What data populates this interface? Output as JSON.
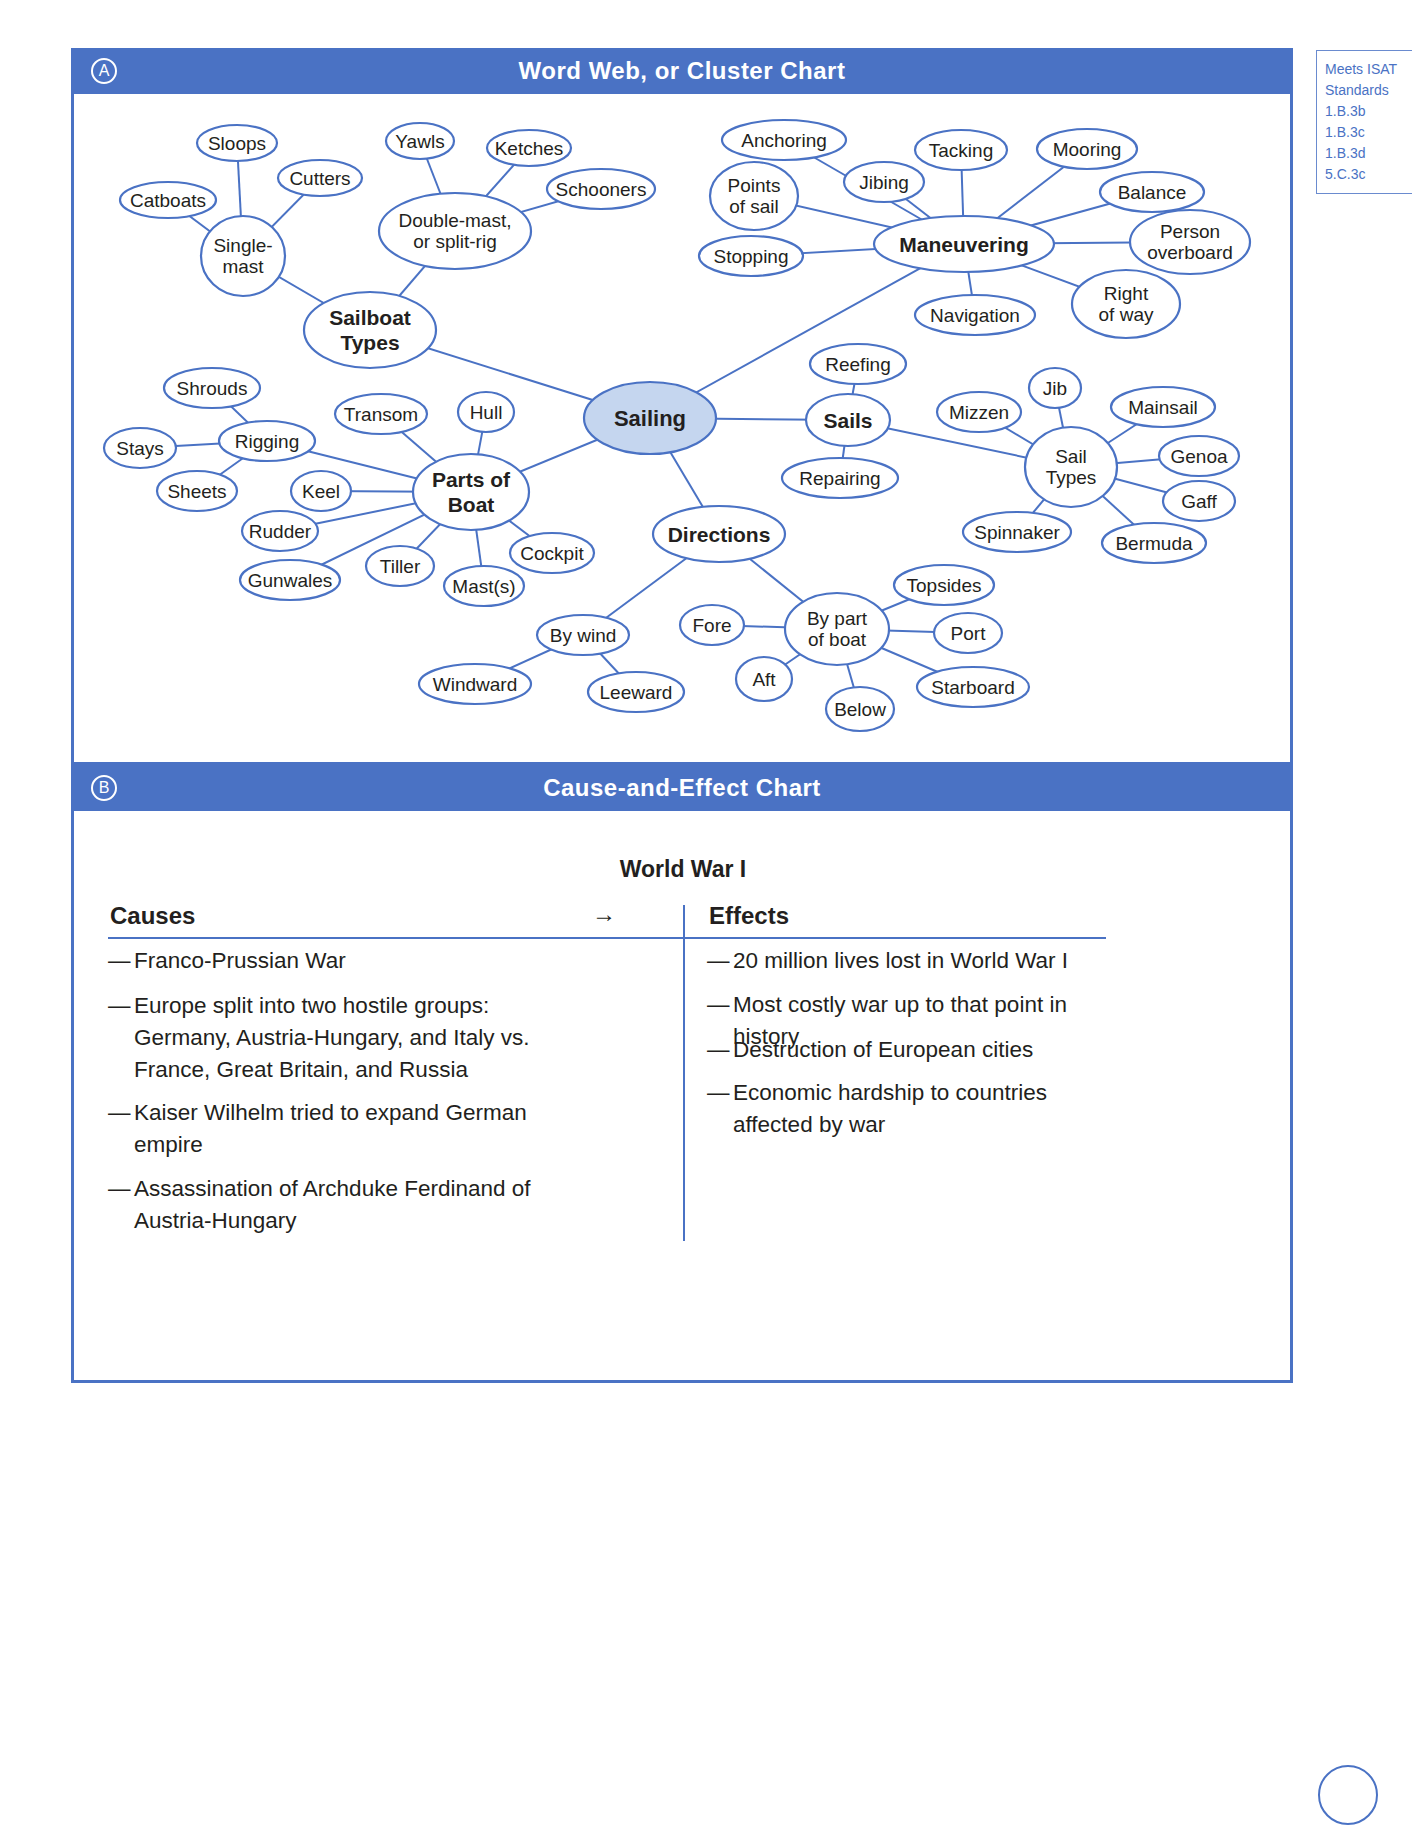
{
  "section_a": {
    "letter": "A",
    "title": "Word Web, or Cluster Chart",
    "center_node": "Sailing",
    "branches": [
      {
        "label": "Sailboat Types",
        "children": [
          {
            "label": "Single-mast",
            "children": [
              "Sloops",
              "Cutters",
              "Catboats"
            ]
          },
          {
            "label": "Double-mast, or split-rig",
            "children": [
              "Yawls",
              "Ketches",
              "Schooners"
            ]
          }
        ]
      },
      {
        "label": "Maneuvering",
        "children": [
          "Anchoring",
          "Points of sail",
          "Jibing",
          "Tacking",
          "Mooring",
          "Balance",
          "Person overboard",
          "Right of way",
          "Navigation",
          "Stopping"
        ]
      },
      {
        "label": "Sails",
        "children": [
          "Reefing",
          "Repairing",
          {
            "label": "Sail Types",
            "children": [
              "Mizzen",
              "Jib",
              "Mainsail",
              "Genoa",
              "Gaff",
              "Spinnaker",
              "Bermuda"
            ]
          }
        ]
      },
      {
        "label": "Parts of Boat",
        "children": [
          "Transom",
          "Hull",
          "Keel",
          "Rudder",
          "Gunwales",
          "Tiller",
          "Mast(s)",
          "Cockpit",
          {
            "label": "Rigging",
            "children": [
              "Shrouds",
              "Stays",
              "Sheets"
            ]
          }
        ]
      },
      {
        "label": "Directions",
        "children": [
          {
            "label": "By wind",
            "children": [
              "Windward",
              "Leeward"
            ]
          },
          {
            "label": "By part of boat",
            "children": [
              "Fore",
              "Topsides",
              "Port",
              "Aft",
              "Below",
              "Starboard"
            ]
          }
        ]
      }
    ],
    "nodes": {
      "sailing": [
        "Sailing"
      ],
      "sailboat_types": [
        "Sailboat",
        "Types"
      ],
      "single_mast": [
        "Single-",
        "mast"
      ],
      "sloops": [
        "Sloops"
      ],
      "cutters": [
        "Cutters"
      ],
      "catboats": [
        "Catboats"
      ],
      "double_mast": [
        "Double-mast,",
        "or split-rig"
      ],
      "yawls": [
        "Yawls"
      ],
      "ketches": [
        "Ketches"
      ],
      "schooners": [
        "Schooners"
      ],
      "maneuvering": [
        "Maneuvering"
      ],
      "anchoring": [
        "Anchoring"
      ],
      "points_of_sail": [
        "Points",
        "of sail"
      ],
      "jibing": [
        "Jibing"
      ],
      "tacking": [
        "Tacking"
      ],
      "mooring": [
        "Mooring"
      ],
      "balance": [
        "Balance"
      ],
      "person_overboard": [
        "Person",
        "overboard"
      ],
      "right_of_way": [
        "Right",
        "of way"
      ],
      "navigation": [
        "Navigation"
      ],
      "stopping": [
        "Stopping"
      ],
      "sails": [
        "Sails"
      ],
      "reefing": [
        "Reefing"
      ],
      "repairing": [
        "Repairing"
      ],
      "sail_types": [
        "Sail",
        "Types"
      ],
      "mizzen": [
        "Mizzen"
      ],
      "jib": [
        "Jib"
      ],
      "mainsail": [
        "Mainsail"
      ],
      "genoa": [
        "Genoa"
      ],
      "gaff": [
        "Gaff"
      ],
      "spinnaker": [
        "Spinnaker"
      ],
      "bermuda": [
        "Bermuda"
      ],
      "parts_of_boat": [
        "Parts of",
        "Boat"
      ],
      "transom": [
        "Transom"
      ],
      "hull": [
        "Hull"
      ],
      "rigging": [
        "Rigging"
      ],
      "shrouds": [
        "Shrouds"
      ],
      "stays": [
        "Stays"
      ],
      "sheets": [
        "Sheets"
      ],
      "keel": [
        "Keel"
      ],
      "rudder": [
        "Rudder"
      ],
      "gunwales": [
        "Gunwales"
      ],
      "tiller": [
        "Tiller"
      ],
      "masts": [
        "Mast(s)"
      ],
      "cockpit": [
        "Cockpit"
      ],
      "directions": [
        "Directions"
      ],
      "by_wind": [
        "By wind"
      ],
      "windward": [
        "Windward"
      ],
      "leeward": [
        "Leeward"
      ],
      "by_part_of_boat": [
        "By part",
        "of boat"
      ],
      "fore": [
        "Fore"
      ],
      "topsides": [
        "Topsides"
      ],
      "port": [
        "Port"
      ],
      "aft": [
        "Aft"
      ],
      "below": [
        "Below"
      ],
      "starboard": [
        "Starboard"
      ]
    }
  },
  "section_b": {
    "letter": "B",
    "title": "Cause-and-Effect Chart",
    "chart_title": "World War I",
    "causes_header": "Causes",
    "arrow": "→",
    "effects_header": "Effects",
    "dash": "—",
    "causes": [
      "Franco-Prussian War",
      "Europe split into two hostile groups: Germany, Austria-Hungary, and Italy vs. France, Great Britain, and Russia",
      "Kaiser Wilhelm tried to expand German empire",
      "Assassination of Archduke Ferdinand of Austria-Hungary"
    ],
    "effects": [
      "20 million lives lost in World War I",
      "Most costly war up to that point in history",
      "Destruction of European cities",
      "Economic hardship to countries affected by war"
    ]
  },
  "standards": {
    "lines": [
      "Meets ISAT",
      "Standards",
      "1.B.3b",
      "1.B.3c",
      "1.B.3d",
      "5.C.3c"
    ]
  },
  "colors": {
    "accent_blue": "#4a72c4",
    "center_fill": "#c5d6ef",
    "text": "#231f20"
  }
}
